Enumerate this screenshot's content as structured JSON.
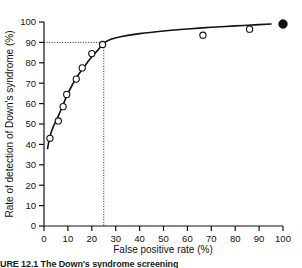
{
  "chart_data": {
    "type": "scatter",
    "title": "",
    "xlabel": "False positive rate (%)",
    "ylabel": "Rate of detection of Down's syndrome (%)",
    "xlim": [
      0,
      100
    ],
    "ylim": [
      0,
      100
    ],
    "xticks": [
      "0",
      "10",
      "20",
      "30",
      "40",
      "50",
      "60",
      "70",
      "80",
      "90",
      "100"
    ],
    "yticks": [
      "0",
      "10",
      "20",
      "30",
      "40",
      "50",
      "60",
      "70",
      "80",
      "90",
      "100"
    ],
    "grid": false,
    "legend": "none",
    "series": [
      {
        "name": "Observed detection rates",
        "marker": "open-circle",
        "points": [
          {
            "x": 2.5,
            "y": 43.0
          },
          {
            "x": 6.0,
            "y": 51.5
          },
          {
            "x": 8.0,
            "y": 58.5
          },
          {
            "x": 9.5,
            "y": 64.5
          },
          {
            "x": 13.5,
            "y": 72.0
          },
          {
            "x": 16.0,
            "y": 77.5
          },
          {
            "x": 20.0,
            "y": 84.5
          },
          {
            "x": 24.5,
            "y": 89.0
          },
          {
            "x": 66.5,
            "y": 93.5
          },
          {
            "x": 86.0,
            "y": 96.5
          }
        ]
      },
      {
        "name": "Endpoint",
        "marker": "filled-circle",
        "points": [
          {
            "x": 100.0,
            "y": 99.0
          }
        ]
      },
      {
        "name": "Fitted ROC curve",
        "marker": "line",
        "points": [
          {
            "x": 1.5,
            "y": 38.0
          },
          {
            "x": 2.5,
            "y": 44.0
          },
          {
            "x": 4.0,
            "y": 49.0
          },
          {
            "x": 6.0,
            "y": 54.0
          },
          {
            "x": 8.0,
            "y": 59.5
          },
          {
            "x": 10.0,
            "y": 65.0
          },
          {
            "x": 12.0,
            "y": 69.5
          },
          {
            "x": 14.0,
            "y": 73.5
          },
          {
            "x": 16.5,
            "y": 77.5
          },
          {
            "x": 19.0,
            "y": 81.5
          },
          {
            "x": 22.0,
            "y": 85.5
          },
          {
            "x": 25.0,
            "y": 89.5
          },
          {
            "x": 28.0,
            "y": 91.5
          },
          {
            "x": 32.0,
            "y": 92.8
          },
          {
            "x": 40.0,
            "y": 94.3
          },
          {
            "x": 50.0,
            "y": 95.6
          },
          {
            "x": 60.0,
            "y": 96.6
          },
          {
            "x": 70.0,
            "y": 97.4
          },
          {
            "x": 80.0,
            "y": 98.1
          },
          {
            "x": 90.0,
            "y": 98.7
          },
          {
            "x": 95.0,
            "y": 99.0
          }
        ]
      }
    ],
    "annotations": {
      "reference_detection_rate": 90,
      "reference_false_positive_rate": 25,
      "reference_line_style": "dotted"
    }
  },
  "caption": {
    "text": "URE 12.1  The Down's syndrome screening"
  }
}
